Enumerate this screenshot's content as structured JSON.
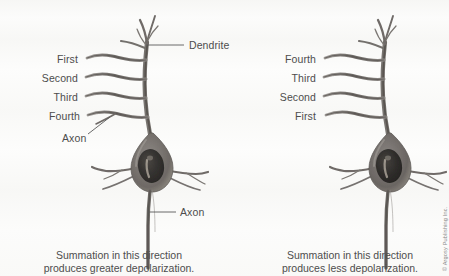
{
  "figure": {
    "background_color": "#fbfbfa",
    "ink_color": "#4d4d4d"
  },
  "left_panel": {
    "name": "left-neuron-panel",
    "labels": {
      "dendrite": "Dendrite",
      "synapse_order": [
        "First",
        "Second",
        "Third",
        "Fourth"
      ],
      "axon_incoming": "Axon",
      "axon_outgoing": "Axon"
    },
    "caption_line_1": "Summation in this direction",
    "caption_line_2": "produces greater depolarization."
  },
  "right_panel": {
    "name": "right-neuron-panel",
    "labels": {
      "synapse_order": [
        "Fourth",
        "Third",
        "Second",
        "First"
      ]
    },
    "caption_line_1": "Summation in this direction",
    "caption_line_2": "produces less depolarization."
  },
  "credit": {
    "text": "© Argosy Publishing Inc."
  }
}
